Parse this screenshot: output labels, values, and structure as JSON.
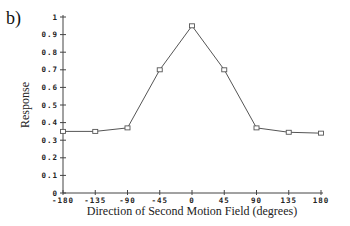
{
  "chart_data": {
    "type": "line",
    "panel_label": "b)",
    "title": "",
    "xlabel": "Direction of Second Motion Field (degrees)",
    "ylabel": "Response",
    "x": [
      -180,
      -135,
      -90,
      -45,
      0,
      45,
      90,
      135,
      180
    ],
    "series": [
      {
        "name": "Response",
        "values": [
          0.35,
          0.35,
          0.37,
          0.7,
          0.95,
          0.7,
          0.37,
          0.345,
          0.34
        ],
        "marker": "square",
        "color": "#555555"
      }
    ],
    "xticks": [
      "-180",
      "-135",
      "-90",
      "-45",
      "0",
      "45",
      "90",
      "135",
      "180"
    ],
    "yticks": [
      "0",
      "0.1",
      "0.2",
      "0.3",
      "0.4",
      "0.5",
      "0.6",
      "0.7",
      "0.8",
      "0.9",
      "1"
    ],
    "xlim": [
      -180,
      180
    ],
    "ylim": [
      0,
      1
    ],
    "grid": false,
    "legend": null
  }
}
